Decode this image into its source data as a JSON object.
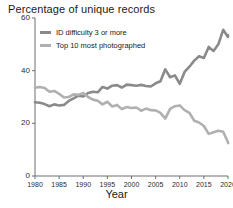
{
  "chart_data": {
    "type": "line",
    "title": "Percentage of unique records",
    "xlabel": "Year",
    "ylabel": "",
    "xlim": [
      1980,
      2020
    ],
    "ylim": [
      0,
      60
    ],
    "grid": false,
    "legend_position": "top-left",
    "yticks": [
      0,
      20,
      40,
      60
    ],
    "ytick_labels": [
      "0",
      "20",
      "40",
      "60"
    ],
    "xticks": [
      1980,
      1985,
      1990,
      1995,
      2000,
      2005,
      2010,
      2015,
      2020
    ],
    "xtick_labels": [
      "1980",
      "1985",
      "1990",
      "1995",
      "2000",
      "2005",
      "2010",
      "2015",
      "2020"
    ],
    "x": [
      1980,
      1981,
      1982,
      1983,
      1984,
      1985,
      1986,
      1987,
      1988,
      1989,
      1990,
      1991,
      1992,
      1993,
      1994,
      1995,
      1996,
      1997,
      1998,
      1999,
      2000,
      2001,
      2002,
      2003,
      2004,
      2005,
      2006,
      2007,
      2008,
      2009,
      2010,
      2011,
      2012,
      2013,
      2014,
      2015,
      2016,
      2017,
      2018,
      2019,
      2020,
      2021
    ],
    "series": [
      {
        "name": "ID difficulty 3 or more",
        "color": "#8a8a8a",
        "values": [
          28.0,
          27.8,
          27.3,
          26.5,
          27.2,
          26.8,
          27.0,
          28.5,
          29.5,
          30.5,
          30.2,
          31.5,
          32.0,
          31.8,
          33.8,
          33.2,
          34.3,
          34.5,
          33.6,
          34.7,
          34.5,
          34.3,
          34.6,
          34.2,
          34.0,
          35.2,
          36.0,
          40.5,
          37.5,
          38.2,
          35.0,
          39.5,
          41.5,
          43.8,
          45.5,
          44.8,
          49.0,
          47.5,
          50.0,
          55.5,
          52.8,
          53.5
        ]
      },
      {
        "name": "Top 10 most photographed",
        "color": "#b0b0b0",
        "values": [
          33.5,
          33.8,
          33.4,
          32.0,
          32.3,
          31.2,
          29.8,
          30.0,
          31.0,
          30.8,
          31.5,
          30.0,
          29.0,
          28.6,
          27.2,
          28.2,
          26.4,
          27.0,
          25.4,
          26.2,
          25.8,
          26.0,
          24.8,
          25.6,
          25.0,
          24.9,
          24.0,
          21.8,
          25.5,
          26.5,
          26.8,
          25.0,
          24.0,
          21.0,
          20.3,
          19.0,
          16.0,
          16.6,
          17.2,
          16.8,
          12.8,
          12.5
        ]
      }
    ]
  }
}
